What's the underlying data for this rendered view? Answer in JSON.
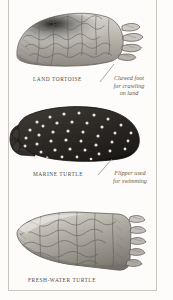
{
  "plate": {
    "background_color": "#fdfcfa",
    "rule_color": "#c9c6bf",
    "caption_color": "#4c4a46",
    "annotation_color": "#6b5a46"
  },
  "figures": [
    {
      "id": "land-tortoise",
      "caption": "Land tortoise",
      "limb_type": "clawed foot",
      "tone": "light grey scaly",
      "claw_count": 4
    },
    {
      "id": "marine-turtle",
      "caption": "Marine turtle",
      "limb_type": "flipper",
      "tone": "dark with pale spots",
      "claw_count": 0
    },
    {
      "id": "freshwater-turtle",
      "caption": "Fresh-water turtle",
      "limb_type": "webbed clawed foot",
      "tone": "mid grey scaly",
      "claw_count": 5
    }
  ],
  "annotations": [
    {
      "id": "clawed-foot",
      "lines": [
        "Clawed foot",
        "for crawling",
        "on land"
      ]
    },
    {
      "id": "flipper",
      "lines": [
        "Flipper used",
        "for swimming"
      ]
    }
  ]
}
